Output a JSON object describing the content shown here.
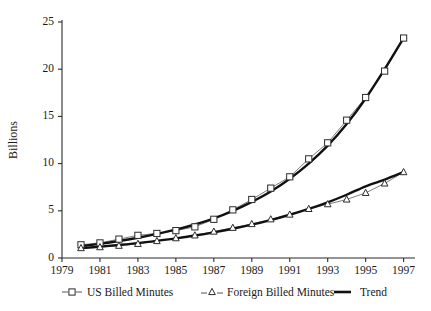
{
  "chart_data": {
    "type": "line",
    "title": "",
    "xlabel": "",
    "ylabel": "Billions",
    "xlim": [
      1979,
      1997.6
    ],
    "ylim": [
      0,
      25
    ],
    "grid": false,
    "legend_position": "bottom",
    "x": [
      1980,
      1981,
      1982,
      1983,
      1984,
      1985,
      1986,
      1987,
      1988,
      1989,
      1990,
      1991,
      1992,
      1993,
      1994,
      1995,
      1996,
      1997
    ],
    "xticks": [
      "1979",
      "1981",
      "1983",
      "1985",
      "1987",
      "1989",
      "1991",
      "1993",
      "1995",
      "1997"
    ],
    "xtick_values": [
      1979,
      1981,
      1983,
      1985,
      1987,
      1989,
      1991,
      1993,
      1995,
      1997
    ],
    "yticks": [
      "0",
      "5",
      "10",
      "15",
      "20",
      "25"
    ],
    "ytick_values": [
      0,
      5,
      10,
      15,
      20,
      25
    ],
    "series": [
      {
        "name": "US Billed Minutes",
        "marker": "square",
        "values": [
          1.4,
          1.6,
          2.0,
          2.4,
          2.6,
          2.9,
          3.3,
          4.1,
          5.1,
          6.2,
          7.4,
          8.6,
          10.5,
          12.2,
          14.6,
          17.0,
          19.8,
          23.3
        ]
      },
      {
        "name": "Foreign Billed Minutes",
        "marker": "triangle",
        "values": [
          1.05,
          1.15,
          1.3,
          1.5,
          1.8,
          2.1,
          2.4,
          2.8,
          3.2,
          3.6,
          4.1,
          4.6,
          5.2,
          5.7,
          6.2,
          6.9,
          7.9,
          9.1
        ]
      },
      {
        "name": "Trend",
        "marker": "none",
        "values_us": [
          1.25,
          1.5,
          1.8,
          2.15,
          2.55,
          3.0,
          3.55,
          4.2,
          5.0,
          5.95,
          7.05,
          8.4,
          10.0,
          11.9,
          14.2,
          16.9,
          20.0,
          23.3
        ],
        "values_foreign": [
          1.05,
          1.2,
          1.38,
          1.58,
          1.82,
          2.08,
          2.38,
          2.72,
          3.1,
          3.53,
          4.02,
          4.58,
          5.2,
          5.9,
          6.7,
          7.6,
          8.3,
          9.1
        ]
      }
    ]
  },
  "axes": {
    "ylabel": "Billions"
  },
  "legend": {
    "items": [
      {
        "label": "US Billed Minutes",
        "marker": "square-marker"
      },
      {
        "label": "Foreign Billed Minutes",
        "marker": "triangle-marker"
      },
      {
        "label": "Trend",
        "marker": "solid-line"
      }
    ]
  },
  "colors": {
    "axis": "#2b2b2b",
    "series": "#6f6f6f",
    "trend": "#111111",
    "marker_fill": "#ffffff",
    "background": "#ffffff"
  }
}
